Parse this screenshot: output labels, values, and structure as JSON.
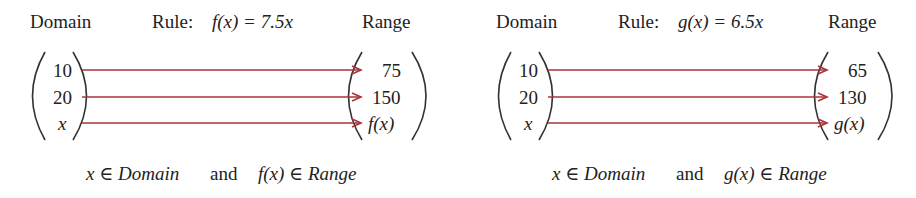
{
  "colors": {
    "arrow": "#a8343a",
    "text": "#222222"
  },
  "panels": [
    {
      "domain_label": "Domain",
      "rule_label": "Rule:",
      "rule_expr": "f(x) = 7.5x",
      "range_label": "Range",
      "domain_values": [
        "10",
        "20",
        "x"
      ],
      "range_values": [
        "75",
        "150",
        "f(x)"
      ],
      "footer_left": "x ∈ Domain",
      "footer_and": "and",
      "footer_right": "f(x) ∈ Range"
    },
    {
      "domain_label": "Domain",
      "rule_label": "Rule:",
      "rule_expr": "g(x) = 6.5x",
      "range_label": "Range",
      "domain_values": [
        "10",
        "20",
        "x"
      ],
      "range_values": [
        "65",
        "130",
        "g(x)"
      ],
      "footer_left": "x ∈ Domain",
      "footer_and": "and",
      "footer_right": "g(x) ∈ Range"
    }
  ]
}
